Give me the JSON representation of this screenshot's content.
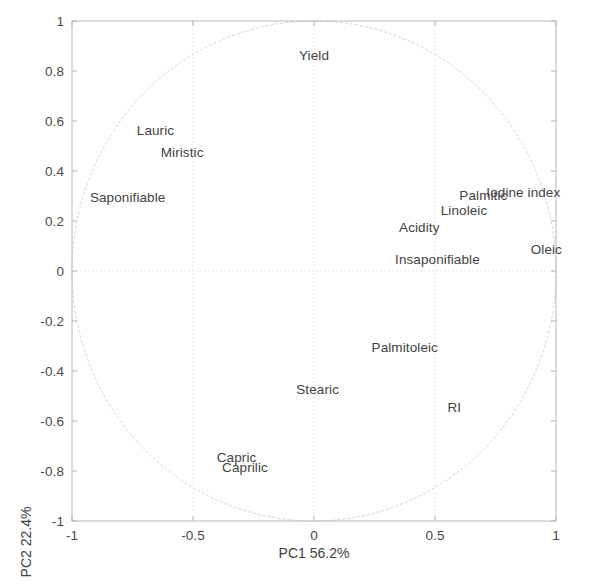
{
  "chart_data": {
    "type": "scatter",
    "title": "",
    "subtitle": "",
    "xlabel": "PC1   56.2%",
    "ylabel": "PC2   22.4%",
    "xlabel_parts": {
      "axis": "PC1",
      "variance": "56.2%"
    },
    "ylabel_parts": {
      "axis": "PC2",
      "variance": "22.4%"
    },
    "xlim": [
      -1,
      1
    ],
    "ylim": [
      -1,
      1
    ],
    "xticks": [
      -1,
      -0.5,
      0,
      0.5,
      1
    ],
    "xticklabels": [
      "-1",
      "-0.5",
      "0",
      "0.5",
      "1"
    ],
    "yticks": [
      -1,
      -0.8,
      -0.6,
      -0.4,
      -0.2,
      0,
      0.2,
      0.4,
      0.6,
      0.8,
      1
    ],
    "yticklabels": [
      "-1",
      "-0.8",
      "-0.6",
      "-0.4",
      "-0.2",
      "0",
      "0.2",
      "0.4",
      "0.6",
      "0.8",
      "1"
    ],
    "grid": true,
    "legend": "none",
    "unit_circle": true,
    "annotations": [
      {
        "label": "Yield",
        "x": 0.0,
        "y": 0.865
      },
      {
        "label": "Lauric",
        "x": -0.655,
        "y": 0.565
      },
      {
        "label": "Miristic",
        "x": -0.545,
        "y": 0.475
      },
      {
        "label": "Saponifiable",
        "x": -0.77,
        "y": 0.295
      },
      {
        "label": "Palmitic",
        "x": 0.7,
        "y": 0.305
      },
      {
        "label": "Iodine index",
        "x": 0.865,
        "y": 0.315
      },
      {
        "label": "Linoleic",
        "x": 0.62,
        "y": 0.245
      },
      {
        "label": "Acidity",
        "x": 0.435,
        "y": 0.175
      },
      {
        "label": "Oleic",
        "x": 0.96,
        "y": 0.09
      },
      {
        "label": "Insaponifiable",
        "x": 0.51,
        "y": 0.05
      },
      {
        "label": "Palmitoleic",
        "x": 0.375,
        "y": -0.305
      },
      {
        "label": "Stearic",
        "x": 0.015,
        "y": -0.47
      },
      {
        "label": "RI",
        "x": 0.58,
        "y": -0.545
      },
      {
        "label": "Capric",
        "x": -0.32,
        "y": -0.745
      },
      {
        "label": "Caprilic",
        "x": -0.285,
        "y": -0.785
      }
    ]
  },
  "colors": {
    "axis": "#b4b4b4",
    "grid": "#e2e2e2",
    "circle": "#d2d2d2",
    "text": "#434343",
    "background": "#ffffff"
  }
}
